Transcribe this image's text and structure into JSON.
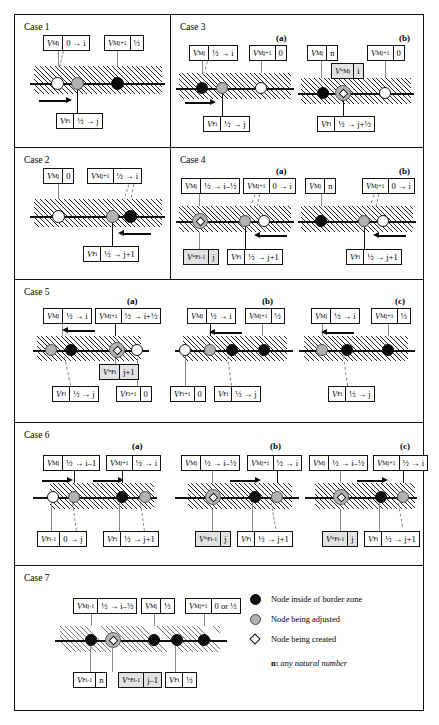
{
  "figure": {
    "title": "",
    "legend": {
      "items": [
        {
          "symbol": "filled-circle",
          "label": "Node inside of border zone"
        },
        {
          "symbol": "gray-circle",
          "label": "Node being adjusted"
        },
        {
          "symbol": "diamond",
          "label": "Node being created"
        }
      ],
      "note_symbol": "n:",
      "note_text": "any natural number"
    }
  },
  "cases": {
    "case1": {
      "title": "Case 1",
      "top_boxes": [
        {
          "sym": "V",
          "sup": "M",
          "sub": "j",
          "val": "0 → i"
        },
        {
          "sym": "V",
          "sup": "M",
          "sub": "j+1",
          "val": "½"
        }
      ],
      "bottom_boxes": [
        {
          "sym": "V",
          "sup": "F",
          "sub": "i",
          "val": "½ → j"
        }
      ],
      "nodes": [
        "white",
        "gray",
        "black"
      ],
      "arrow": "right"
    },
    "case2": {
      "title": "Case 2",
      "top_boxes": [
        {
          "sym": "V",
          "sup": "M",
          "sub": "j",
          "val": "0"
        },
        {
          "sym": "V",
          "sup": "M",
          "sub": "j+1",
          "val": "½ → i"
        }
      ],
      "bottom_boxes": [
        {
          "sym": "V",
          "sup": "F",
          "sub": "i",
          "val": "½ → j+1"
        }
      ],
      "nodes": [
        "white",
        "gray",
        "black"
      ],
      "arrow": "left"
    },
    "case3": {
      "title": "Case 3",
      "a": {
        "label": "(a)",
        "top_boxes": [
          {
            "sym": "V",
            "sup": "M",
            "sub": "j",
            "val": "½ → i"
          },
          {
            "sym": "V",
            "sup": "M",
            "sub": "j+1",
            "val": "0"
          }
        ],
        "bottom_boxes": [
          {
            "sym": "V",
            "sup": "F",
            "sub": "i",
            "val": "½ → j"
          }
        ],
        "nodes": [
          "black",
          "gray",
          "white"
        ],
        "arrow": "right"
      },
      "b": {
        "label": "(b)",
        "top_boxes": [
          {
            "sym": "V",
            "sup": "M",
            "sub": "j",
            "val": "n"
          },
          {
            "sym": "V",
            "sup": "M",
            "sub": "j+1",
            "val": "0"
          }
        ],
        "mid_boxes": [
          {
            "sym": "V",
            "sup": "*M",
            "sub": "j",
            "val": "i",
            "shaded": true
          }
        ],
        "bottom_boxes": [
          {
            "sym": "V",
            "sup": "F",
            "sub": "i",
            "val": "½ → j+½"
          }
        ],
        "nodes": [
          "black",
          "diamond",
          "white"
        ],
        "arrow": "none"
      }
    },
    "case4": {
      "title": "Case 4",
      "a": {
        "label": "(a)",
        "top_boxes": [
          {
            "sym": "V",
            "sup": "M",
            "sub": "j",
            "val": "½ → i–½"
          },
          {
            "sym": "V",
            "sup": "M",
            "sub": "j+1",
            "val": "0 → i"
          }
        ],
        "bottom_boxes": [
          {
            "sym": "V",
            "sup": "*F",
            "sub": "i-1",
            "val": "j",
            "shaded": true
          },
          {
            "sym": "V",
            "sup": "F",
            "sub": "i",
            "val": "½ → j+1"
          }
        ],
        "nodes": [
          "diamond",
          "gray",
          "white"
        ],
        "arrow": "left"
      },
      "b": {
        "label": "(b)",
        "top_boxes": [
          {
            "sym": "V",
            "sup": "M",
            "sub": "j",
            "val": "n"
          },
          {
            "sym": "V",
            "sup": "M",
            "sub": "j+1",
            "val": "0 → i"
          }
        ],
        "bottom_boxes": [
          {
            "sym": "V",
            "sup": "F",
            "sub": "i",
            "val": "½ → j+1"
          }
        ],
        "nodes": [
          "black",
          "gray",
          "white"
        ],
        "arrow": "left"
      }
    },
    "case5": {
      "title": "Case 5",
      "a": {
        "label": "(a)",
        "top_boxes": [
          {
            "sym": "V",
            "sup": "M",
            "sub": "j",
            "val": "½ → i"
          },
          {
            "sym": "V",
            "sup": "M",
            "sub": "j+1",
            "val": "½ → i+½"
          }
        ],
        "mid_boxes": [
          {
            "sym": "V",
            "sup": "*F",
            "sub": "i",
            "val": "j+1",
            "shaded": true
          }
        ],
        "bottom_boxes": [
          {
            "sym": "V",
            "sup": "F",
            "sub": "i",
            "val": "½ → j"
          },
          {
            "sym": "V",
            "sup": "F",
            "sub": "i+1",
            "val": "0"
          }
        ],
        "nodes": [
          "gray",
          "black",
          "diamond",
          "white"
        ],
        "arrow": "left"
      },
      "b": {
        "label": "(b)",
        "top_boxes": [
          {
            "sym": "V",
            "sup": "M",
            "sub": "j",
            "val": "½ → i"
          },
          {
            "sym": "V",
            "sup": "M",
            "sub": "j+1",
            "val": "½"
          }
        ],
        "bottom_boxes": [
          {
            "sym": "V",
            "sup": "F",
            "sub": "i+1",
            "val": "0"
          },
          {
            "sym": "V",
            "sup": "F",
            "sub": "i",
            "val": "½ → j"
          }
        ],
        "nodes": [
          "white",
          "gray",
          "black",
          "black"
        ],
        "arrow": "left"
      },
      "c": {
        "label": "(c)",
        "top_boxes": [
          {
            "sym": "V",
            "sup": "M",
            "sub": "j",
            "val": "½ → i"
          },
          {
            "sym": "V",
            "sup": "M",
            "sub": "j+1",
            "val": "½"
          }
        ],
        "bottom_boxes": [
          {
            "sym": "V",
            "sup": "F",
            "sub": "i",
            "val": "½ → j"
          }
        ],
        "nodes": [
          "gray",
          "black",
          "black"
        ],
        "arrow": "left"
      }
    },
    "case6": {
      "title": "Case 6",
      "a": {
        "label": "(a)",
        "top_boxes": [
          {
            "sym": "V",
            "sup": "M",
            "sub": "j",
            "val": "½ → i–1"
          },
          {
            "sym": "V",
            "sup": "M",
            "sub": "j+1",
            "val": "½ → i"
          }
        ],
        "bottom_boxes": [
          {
            "sym": "V",
            "sup": "F",
            "sub": "i-1",
            "val": "0 → j"
          },
          {
            "sym": "V",
            "sup": "F",
            "sub": "i",
            "val": "½ → j+1"
          }
        ],
        "nodes": [
          "white",
          "gray",
          "black",
          "gray"
        ],
        "arrows": [
          "right",
          "right"
        ]
      },
      "b": {
        "label": "(b)",
        "top_boxes": [
          {
            "sym": "V",
            "sup": "M",
            "sub": "j",
            "val": "½ → i–½"
          },
          {
            "sym": "V",
            "sup": "M",
            "sub": "j+1",
            "val": "½ → i"
          }
        ],
        "bottom_boxes": [
          {
            "sym": "V",
            "sup": "*F",
            "sub": "i-1",
            "val": "j",
            "shaded": true
          },
          {
            "sym": "V",
            "sup": "F",
            "sub": "i",
            "val": "½ → j+1"
          }
        ],
        "nodes": [
          "diamond",
          "black",
          "gray"
        ],
        "arrows": [
          "right"
        ]
      },
      "c": {
        "label": "(c)",
        "top_boxes": [
          {
            "sym": "V",
            "sup": "M",
            "sub": "j",
            "val": "½ → i–½"
          },
          {
            "sym": "V",
            "sup": "M",
            "sub": "j+1",
            "val": "½ → i"
          }
        ],
        "bottom_boxes": [
          {
            "sym": "V",
            "sup": "*F",
            "sub": "i-1",
            "val": "j",
            "shaded": true
          },
          {
            "sym": "V",
            "sup": "F",
            "sub": "i",
            "val": "½ → j+1"
          }
        ],
        "nodes": [
          "diamond",
          "black",
          "gray"
        ],
        "arrows": [
          "right"
        ]
      }
    },
    "case7": {
      "title": "Case 7",
      "top_boxes": [
        {
          "sym": "V",
          "sup": "M",
          "sub": "j-1",
          "val": "½ → i–½"
        },
        {
          "sym": "V",
          "sup": "M",
          "sub": "j",
          "val": "½"
        },
        {
          "sym": "V",
          "sup": "M",
          "sub": "j+1",
          "val": "0 or ½"
        }
      ],
      "bottom_boxes": [
        {
          "sym": "V",
          "sup": "F",
          "sub": "i-1",
          "val": "n"
        },
        {
          "sym": "V",
          "sup": "*F",
          "sub": "i-1",
          "val": "j–1",
          "shaded": true
        },
        {
          "sym": "V",
          "sup": "F",
          "sub": "i",
          "val": "½"
        }
      ],
      "nodes": [
        "black",
        "diamond",
        "black",
        "black",
        "black"
      ]
    }
  }
}
